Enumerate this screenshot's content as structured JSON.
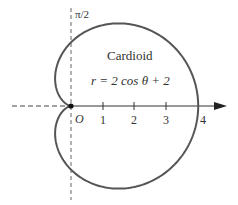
{
  "figure": {
    "title": "Cardioid",
    "equation": "r = 2  cos θ + 2",
    "pole_label": "O",
    "axis_label_top": "π/2",
    "tick_labels": [
      "1",
      "2",
      "3",
      "4"
    ],
    "curve_color": "#555555"
  },
  "chart_data": {
    "type": "polar-curve",
    "title": "Cardioid",
    "equation": "r = 2 cos θ + 2",
    "polar_axis_ticks": [
      1,
      2,
      3,
      4
    ],
    "vertical_axis_label": "π/2",
    "origin_label": "O",
    "xlim": [
      -2,
      5
    ],
    "ylim": [
      -3,
      3
    ]
  }
}
